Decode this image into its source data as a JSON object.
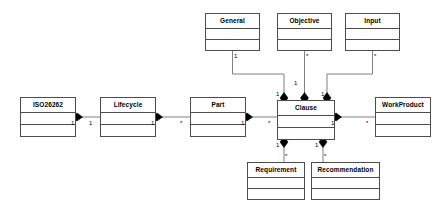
{
  "diagram": {
    "kind": "uml-class-diagram",
    "colors": {
      "background": "#ffffff",
      "stroke": "#4c4c4c",
      "line": "#808080",
      "diamond": "#000000",
      "text": "#000000"
    },
    "classes": [
      {
        "id": "general",
        "name": "General",
        "x": 205,
        "y": 13,
        "w": 55,
        "h": 38
      },
      {
        "id": "objective",
        "name": "Objective",
        "x": 277,
        "y": 13,
        "w": 55,
        "h": 38
      },
      {
        "id": "input",
        "name": "Input",
        "x": 345,
        "y": 13,
        "w": 55,
        "h": 38
      },
      {
        "id": "iso26262",
        "name": "ISO26262",
        "x": 20,
        "y": 97,
        "w": 56,
        "h": 40
      },
      {
        "id": "lifecycle",
        "name": "Lifecycle",
        "x": 100,
        "y": 97,
        "w": 56,
        "h": 40
      },
      {
        "id": "part",
        "name": "Part",
        "x": 190,
        "y": 97,
        "w": 56,
        "h": 40
      },
      {
        "id": "clause",
        "name": "Clause",
        "x": 277,
        "y": 100,
        "w": 58,
        "h": 40
      },
      {
        "id": "workproduct",
        "name": "WorkProduct",
        "x": 375,
        "y": 97,
        "w": 56,
        "h": 40
      },
      {
        "id": "requirement",
        "name": "Requirement",
        "x": 247,
        "y": 162,
        "w": 58,
        "h": 38
      },
      {
        "id": "recommendation",
        "name": "Recommendation",
        "x": 311,
        "y": 162,
        "w": 69,
        "h": 38
      }
    ],
    "multiplicities": [
      {
        "id": "m-general-1",
        "label": "1",
        "x": 234,
        "y": 53
      },
      {
        "id": "m-objective-star",
        "label": "*",
        "x": 306,
        "y": 53
      },
      {
        "id": "m-input-star",
        "label": "*",
        "x": 374,
        "y": 53
      },
      {
        "id": "m-objective-1",
        "label": "1",
        "x": 294,
        "y": 80
      },
      {
        "id": "m-clause-top-left",
        "label": "1",
        "x": 276,
        "y": 91
      },
      {
        "id": "m-clause-top-right",
        "label": "1",
        "x": 321,
        "y": 91
      },
      {
        "id": "m-iso-1",
        "label": "1",
        "x": 71,
        "y": 120
      },
      {
        "id": "m-lifecycle-left-1",
        "label": "1",
        "x": 89,
        "y": 120
      },
      {
        "id": "m-lifecycle-rt-1",
        "label": "1",
        "x": 151,
        "y": 120
      },
      {
        "id": "m-part-left-star",
        "label": "*",
        "x": 180,
        "y": 120
      },
      {
        "id": "m-part-right-1",
        "label": "1",
        "x": 241,
        "y": 120
      },
      {
        "id": "m-clause-left-star",
        "label": "*",
        "x": 268,
        "y": 120
      },
      {
        "id": "m-clause-right-1",
        "label": "1",
        "x": 331,
        "y": 120
      },
      {
        "id": "m-workproduct-star",
        "label": "*",
        "x": 366,
        "y": 120
      },
      {
        "id": "m-req-clause-1",
        "label": "1",
        "x": 276,
        "y": 142
      },
      {
        "id": "m-rec-clause-1",
        "label": "1",
        "x": 315,
        "y": 142
      },
      {
        "id": "m-req-star",
        "label": "*",
        "x": 285,
        "y": 153
      },
      {
        "id": "m-rec-star",
        "label": "*",
        "x": 324,
        "y": 153
      }
    ],
    "connectors": [
      {
        "id": "general-to-clause",
        "points": "232.5,51 232.5,74 284,74 284,100"
      },
      {
        "id": "objective-to-clause",
        "points": "304.5,51 304.5,100"
      },
      {
        "id": "input-to-clause",
        "points": "372.5,51 372.5,74 327,74 327,100"
      },
      {
        "id": "iso-to-lifecycle",
        "points": "76,117 100,117"
      },
      {
        "id": "lifecycle-to-part",
        "points": "156,117 190,117"
      },
      {
        "id": "part-to-clause",
        "points": "246,117 277,117"
      },
      {
        "id": "clause-to-workproduct",
        "points": "335,117 375,117"
      },
      {
        "id": "clause-to-requirement",
        "points": "284,140 284,162"
      },
      {
        "id": "clause-to-recommendation",
        "points": "323,140 323,162"
      }
    ],
    "diamonds": [
      {
        "id": "d-clause-top-general",
        "cx": 284,
        "cy": 98,
        "dir": "v"
      },
      {
        "id": "d-clause-top-objective",
        "cx": 304.5,
        "cy": 98,
        "dir": "v"
      },
      {
        "id": "d-clause-top-input",
        "cx": 327,
        "cy": 98,
        "dir": "v"
      },
      {
        "id": "d-iso-right",
        "cx": 77,
        "cy": 117,
        "dir": "h"
      },
      {
        "id": "d-lifecycle-right",
        "cx": 157,
        "cy": 117,
        "dir": "h"
      },
      {
        "id": "d-part-right",
        "cx": 247,
        "cy": 117,
        "dir": "h"
      },
      {
        "id": "d-clause-right",
        "cx": 336,
        "cy": 117,
        "dir": "h"
      },
      {
        "id": "d-clause-bot-req",
        "cx": 284,
        "cy": 142,
        "dir": "v"
      },
      {
        "id": "d-clause-bot-rec",
        "cx": 323,
        "cy": 142,
        "dir": "v"
      }
    ]
  }
}
